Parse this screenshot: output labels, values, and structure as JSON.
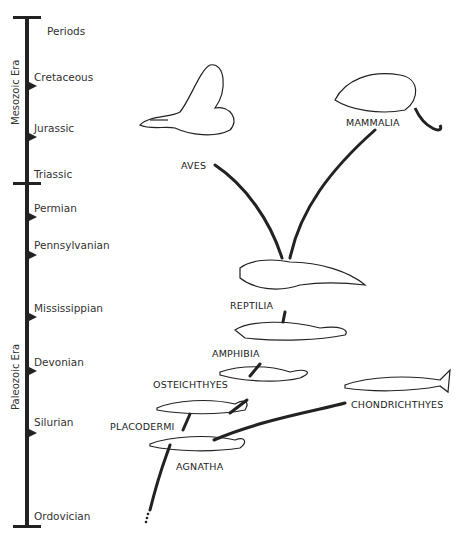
{
  "timescale": {
    "header": "Periods",
    "eras": [
      {
        "label": "Mesozoic Era"
      },
      {
        "label": "Paleozoic Era"
      }
    ],
    "periods": [
      {
        "label": "Cretaceous"
      },
      {
        "label": "Jurassic"
      },
      {
        "label": "Triassic"
      },
      {
        "label": "Permian"
      },
      {
        "label": "Pennsylvanian"
      },
      {
        "label": "Mississippian"
      },
      {
        "label": "Devonian"
      },
      {
        "label": "Silurian"
      },
      {
        "label": "Ordovician"
      }
    ]
  },
  "taxa": {
    "aves": "AVES",
    "mammalia": "MAMMALIA",
    "reptilia": "REPTILIA",
    "amphibia": "AMPHIBIA",
    "osteichthyes": "OSTEICHTHYES",
    "chondrichthyes": "CHONDRICHTHYES",
    "placodermi": "PLACODERMI",
    "agnatha": "AGNATHA"
  }
}
